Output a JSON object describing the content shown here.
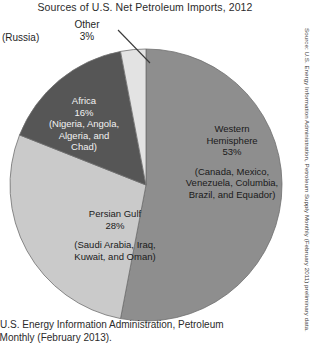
{
  "chart_data": {
    "type": "pie",
    "title": "Sources of U.S. Net Petroleum Imports, 2012",
    "categories": [
      "Western Hemisphere",
      "Persian Gulf",
      "Africa",
      "Other"
    ],
    "values": [
      53,
      28,
      16,
      3
    ],
    "value_unit": "%",
    "start_angle_deg": 0,
    "direction": "clockwise",
    "legend": "none",
    "grid": false,
    "slices": [
      {
        "name": "Western Hemisphere",
        "percent_text": "53%",
        "value": 53,
        "detail": "(Canada, Mexico, Venezuela, Columbia, Brazil, and Equador)",
        "color": "#8e8e8e",
        "text_color": "#1a1a1a"
      },
      {
        "name": "Persian Gulf",
        "percent_text": "28%",
        "value": 28,
        "detail": "(Saudi Arabia, Iraq, Kuwait, and Oman)",
        "color": "#cacaca",
        "text_color": "#1a1a1a"
      },
      {
        "name": "Africa",
        "percent_text": "16%",
        "value": 16,
        "detail": "(Nigeria, Angola, Algeria, and Chad)",
        "color": "#565656",
        "text_color": "#f2f2f2"
      },
      {
        "name": "Other",
        "percent_text": "3%",
        "value": 3,
        "detail": "(Russia)",
        "color": "#e3e3e3",
        "text_color": "#1a1a1a"
      }
    ]
  },
  "callout": {
    "other_name": "Other",
    "other_percent": "3%",
    "russia_label": "(Russia)"
  },
  "labels": {
    "africa": {
      "name": "Africa",
      "percent": "16%",
      "detail_line1": "(Nigeria, Angola,",
      "detail_line2": "Algeria, and",
      "detail_line3": "Chad)"
    },
    "western": {
      "name_line1": "Western",
      "name_line2": "Hemisphere",
      "percent": "53%",
      "detail_line1": "(Canada, Mexico,",
      "detail_line2": "Venezuela,",
      "detail_line3": "Columbia, Brazil,",
      "detail_line4": "and Equador)"
    },
    "gulf": {
      "name": "Persian Gulf",
      "percent": "28%",
      "detail_line1": "(Saudi Arabia, Iraq,",
      "detail_line2": "Kuwait, and Oman)"
    }
  },
  "source_bottom": {
    "line1": "ce: U.S. Energy Information Administration, Petroleum",
    "line2": "ply Monthly (February 2013)."
  },
  "source_vertical": {
    "text": "Source: U.S. Energy Information Administration, Petroleum Supply Monthly (February 2011) preliminary data."
  },
  "colors": {
    "western_hemisphere": "#8e8e8e",
    "persian_gulf": "#cacaca",
    "africa": "#565656",
    "other": "#e3e3e3",
    "outline": "#6f6f6f",
    "background": "#ffffff"
  }
}
